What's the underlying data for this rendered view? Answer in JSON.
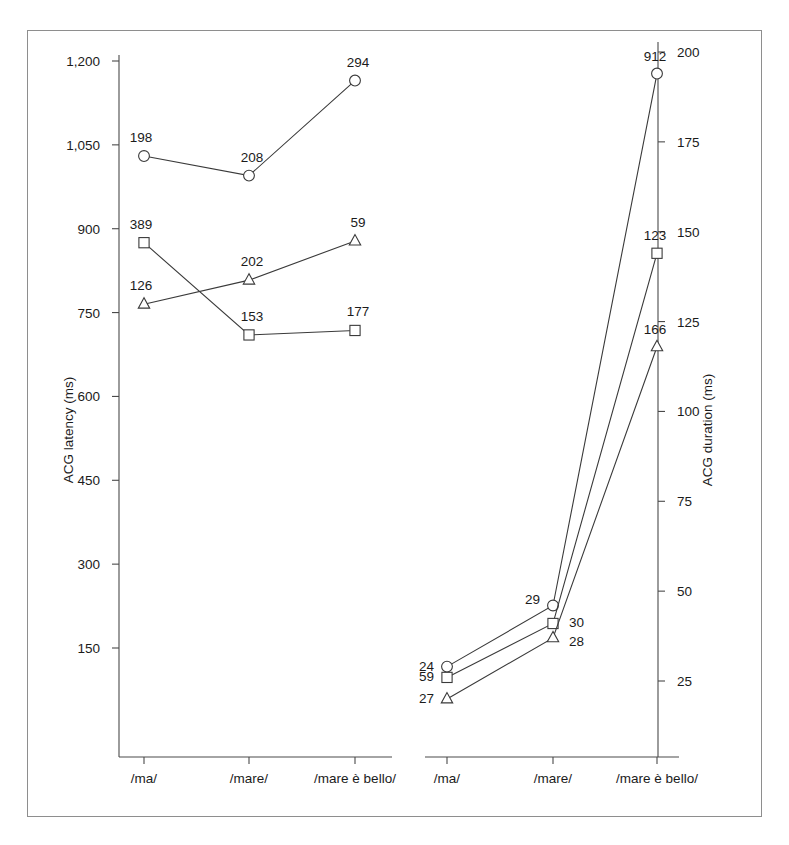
{
  "figure": {
    "background": "#ffffff",
    "frame_color": "#8e8e8e",
    "line_color": "#3a3a3a"
  },
  "chart_data": {
    "type": "line",
    "title": "",
    "panels": [
      {
        "name": "left-panel",
        "ylabel": "ACG latency (ms)",
        "xlabel": "",
        "ylim": [
          75,
          1200
        ],
        "yticks": [
          150,
          300,
          450,
          600,
          750,
          900,
          1050,
          1200
        ],
        "ytick_labels": [
          "150",
          "300",
          "450",
          "600",
          "750",
          "900",
          "1,050",
          "1,200"
        ],
        "categories": [
          "/ma/",
          "/mare/",
          "/mare è bello/"
        ],
        "grid": false,
        "legend": "none",
        "series": [
          {
            "name": "circle-series",
            "marker": "circle",
            "values": [
              1030,
              995,
              1165
            ],
            "point_labels": [
              "198",
              "208",
              "294"
            ]
          },
          {
            "name": "square-series",
            "marker": "square",
            "values": [
              875,
              710,
              718
            ],
            "point_labels": [
              "389",
              "153",
              "177"
            ]
          },
          {
            "name": "triangle-series",
            "marker": "triangle",
            "values": [
              765,
              808,
              878
            ],
            "point_labels": [
              "126",
              "202",
              "59"
            ]
          }
        ]
      },
      {
        "name": "right-panel",
        "ylabel": "ACG duration (ms)",
        "xlabel": "",
        "ylim": [
          8,
          200
        ],
        "yticks": [
          25,
          50,
          75,
          100,
          125,
          150,
          175,
          200
        ],
        "ytick_labels": [
          "25",
          "50",
          "75",
          "100",
          "125",
          "150",
          "175",
          "200"
        ],
        "categories": [
          "/ma/",
          "/mare/",
          "/mare è bello/"
        ],
        "grid": false,
        "legend": "none",
        "series": [
          {
            "name": "circle-series",
            "marker": "circle",
            "values": [
              29,
              46,
              194
            ],
            "point_labels": [
              "24",
              "29",
              "912"
            ]
          },
          {
            "name": "square-series",
            "marker": "square",
            "values": [
              26,
              41,
              144
            ],
            "point_labels": [
              "59",
              "30",
              "123"
            ]
          },
          {
            "name": "triangle-series",
            "marker": "triangle",
            "values": [
              20,
              37,
              118
            ],
            "point_labels": [
              "27",
              "28",
              "166"
            ]
          }
        ]
      }
    ]
  }
}
